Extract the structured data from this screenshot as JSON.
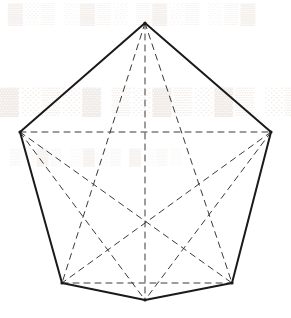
{
  "figure": {
    "canvas": {
      "width": 291,
      "height": 318
    },
    "background_color": "#ffffff",
    "outline_color": "#1a1a1a",
    "outline_width": 2,
    "diagonal_color": "#3a3a3a",
    "diagonal_width": 1,
    "diagonal_dash": "6 5",
    "vertex_dot_color": "#1a1a1a"
  },
  "vertices": [
    {
      "id": "top",
      "label": "top vertex",
      "x": 145,
      "y": 23
    },
    {
      "id": "right",
      "label": "right vertex",
      "x": 271,
      "y": 132
    },
    {
      "id": "bottom-right",
      "label": "bottom right vertex",
      "x": 232,
      "y": 283
    },
    {
      "id": "bottom",
      "label": "bottom center vertex",
      "x": 145,
      "y": 300
    },
    {
      "id": "bottom-left",
      "label": "bottom left vertex",
      "x": 62,
      "y": 283
    },
    {
      "id": "left",
      "label": "left vertex",
      "x": 20,
      "y": 132
    }
  ],
  "edges": [
    {
      "id": "edge-top-right",
      "from": "top",
      "to": "right",
      "style": "solid"
    },
    {
      "id": "edge-right-bottomright",
      "from": "right",
      "to": "bottom-right",
      "style": "solid"
    },
    {
      "id": "edge-bottomright-bottom",
      "from": "bottom-right",
      "to": "bottom",
      "style": "solid"
    },
    {
      "id": "edge-bottom-bottomleft",
      "from": "bottom",
      "to": "bottom-left",
      "style": "solid"
    },
    {
      "id": "edge-bottomleft-left",
      "from": "bottom-left",
      "to": "left",
      "style": "solid"
    },
    {
      "id": "edge-left-top",
      "from": "left",
      "to": "top",
      "style": "solid"
    }
  ],
  "diagonals": [
    {
      "id": "diag-top-bottomleft",
      "from": "top",
      "to": "bottom-left",
      "style": "dashed"
    },
    {
      "id": "diag-top-bottom",
      "from": "top",
      "to": "bottom",
      "style": "dashed"
    },
    {
      "id": "diag-top-bottomright",
      "from": "top",
      "to": "bottom-right",
      "style": "dashed"
    },
    {
      "id": "diag-left-right",
      "from": "left",
      "to": "right",
      "style": "dashed"
    },
    {
      "id": "diag-left-bottomright",
      "from": "left",
      "to": "bottom-right",
      "style": "dashed"
    },
    {
      "id": "diag-left-bottom",
      "from": "left",
      "to": "bottom",
      "style": "dashed"
    },
    {
      "id": "diag-right-bottomleft",
      "from": "right",
      "to": "bottom-left",
      "style": "dashed"
    },
    {
      "id": "diag-right-bottom",
      "from": "right",
      "to": "bottom",
      "style": "dashed"
    },
    {
      "id": "diag-bottomleft-bottomright",
      "from": "bottom-left",
      "to": "bottom-right",
      "style": "dashed"
    }
  ],
  "intersections": [
    {
      "id": "center",
      "label": "center crossing point",
      "x": 145,
      "y": 222
    }
  ],
  "watermark": {
    "visible": true,
    "color": "#f3eeea",
    "lines": [
      {
        "id": "wm-line-1",
        "text": "▓░▒ ░▓▒░ ▒▓░▒ ░▒▓"
      },
      {
        "id": "wm-line-2",
        "text": "▓░▒░▓ ▒░▓▒░▓▒ ░▒▓░ ▒"
      },
      {
        "id": "wm-line-3",
        "text": "▒░▓▒ ░▓░▒ ▓░▒░"
      }
    ]
  }
}
